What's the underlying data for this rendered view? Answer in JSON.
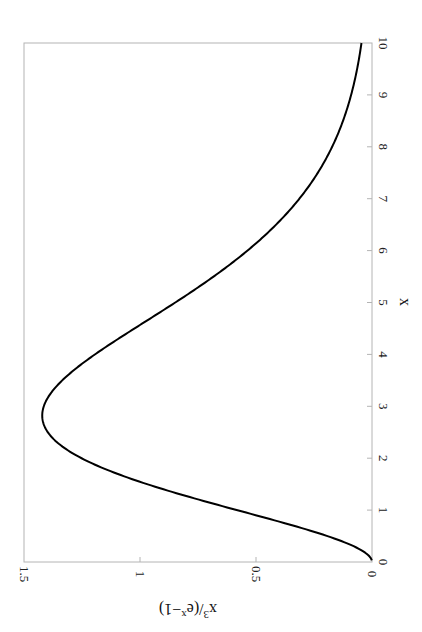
{
  "chart_data": {
    "type": "line",
    "title": "",
    "orientation": "rotated 90 degrees clockwise (x-axis runs vertically along right edge, y-axis along bottom edge)",
    "xlabel": "x",
    "ylabel": "x^3/(e^x-1)",
    "xlim": [
      0,
      10
    ],
    "ylim": [
      0,
      1.5
    ],
    "grid": false,
    "legend": null,
    "x_ticks": [
      "0",
      "1",
      "2",
      "3",
      "4",
      "5",
      "6",
      "7",
      "8",
      "9",
      "10"
    ],
    "y_ticks": [
      "0",
      "0.5",
      "1",
      "1.5"
    ],
    "series": [
      {
        "name": "x^3/(e^x-1)",
        "x": [
          0,
          0.5,
          1,
          1.5,
          2,
          2.5,
          2.82,
          3,
          3.5,
          4,
          4.5,
          5,
          5.5,
          6,
          6.5,
          7,
          7.5,
          8,
          8.5,
          9,
          9.5,
          10
        ],
        "values": [
          0,
          0.192,
          0.582,
          0.966,
          1.252,
          1.399,
          1.421,
          1.415,
          1.318,
          1.194,
          1.013,
          0.852,
          0.681,
          0.537,
          0.412,
          0.31,
          0.232,
          0.172,
          0.125,
          0.09,
          0.065,
          0.045
        ]
      }
    ]
  },
  "axis_labels": {
    "x": "x",
    "y_main": "x",
    "y_sup1": "3",
    "y_mid": "/(e",
    "y_sup2": "x",
    "y_end": "−1)"
  },
  "ticks": {
    "x": [
      "0",
      "1",
      "2",
      "3",
      "4",
      "5",
      "6",
      "7",
      "8",
      "9",
      "10"
    ],
    "y": [
      "1.5",
      "1",
      "0.5",
      "0"
    ]
  }
}
